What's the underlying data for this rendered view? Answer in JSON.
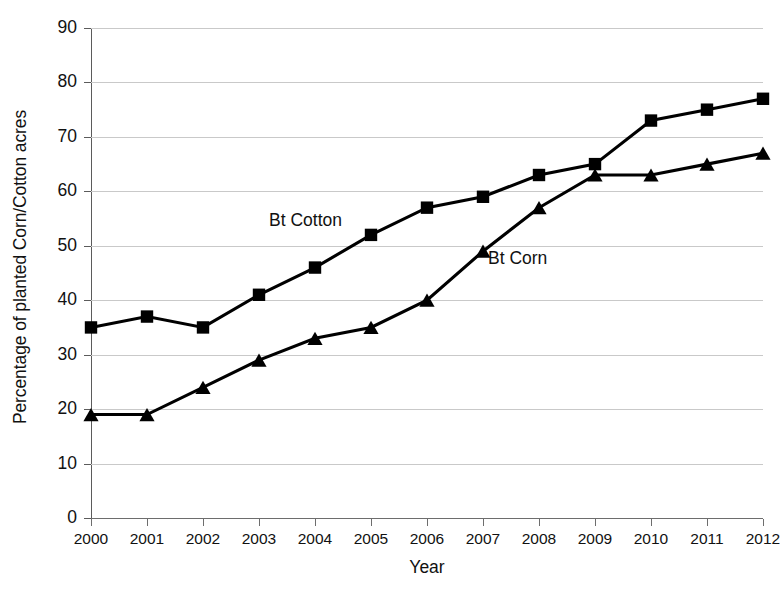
{
  "chart_data": {
    "type": "line",
    "title": "",
    "xlabel": "Year",
    "ylabel": "Percentage of planted Corn/Cotton acres",
    "categories": [
      "2000",
      "2001",
      "2002",
      "2003",
      "2004",
      "2005",
      "2006",
      "2007",
      "2008",
      "2009",
      "2010",
      "2011",
      "2012"
    ],
    "x": [
      2000,
      2001,
      2002,
      2003,
      2004,
      2005,
      2006,
      2007,
      2008,
      2009,
      2010,
      2011,
      2012
    ],
    "ylim": [
      0,
      90
    ],
    "xlim": [
      2000,
      2012
    ],
    "ytick_step": 10,
    "yticks": [
      "90",
      "80",
      "70",
      "60",
      "50",
      "40",
      "30",
      "20",
      "10",
      "0"
    ],
    "grid": true,
    "legend_position": "inline-annotations",
    "series": [
      {
        "name": "Bt Cotton",
        "marker": "square",
        "color": "#000000",
        "values": [
          35,
          37,
          35,
          41,
          46,
          52,
          57,
          59,
          63,
          65,
          73,
          75,
          77
        ]
      },
      {
        "name": "Bt Corn",
        "marker": "triangle",
        "color": "#000000",
        "values": [
          19,
          19,
          24,
          29,
          33,
          35,
          40,
          49,
          57,
          63,
          63,
          65,
          67
        ]
      }
    ],
    "annotations": [
      {
        "text": "Bt Cotton",
        "series": "Bt Cotton"
      },
      {
        "text": "Bt Corn",
        "series": "Bt Corn"
      }
    ]
  },
  "axis": {
    "x_title": "Year",
    "y_title": "Percentage of planted Corn/Cotton acres"
  },
  "style": {
    "gridline_color": "#c9c9c9",
    "axis_color": "#5b5b5b",
    "series_color": "#000000",
    "background": "#ffffff"
  }
}
